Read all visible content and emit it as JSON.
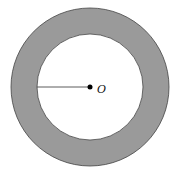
{
  "diagram": {
    "type": "annulus",
    "center_label": "O",
    "outer_circle": {
      "cx": 90,
      "cy": 87,
      "r": 79
    },
    "inner_circle": {
      "cx": 90,
      "cy": 87,
      "r": 53
    },
    "radius_segment": {
      "x1": 37,
      "y1": 87,
      "x2": 90,
      "y2": 87
    },
    "colors": {
      "ring_fill": "#9a9a9a",
      "stroke": "#333333",
      "inner_fill": "#ffffff"
    }
  }
}
